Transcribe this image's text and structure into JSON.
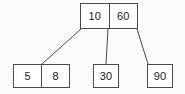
{
  "diagram": {
    "background_color": "#fbfbfa",
    "line_color": "#4a4a4a",
    "text_color": "#1a1a1a",
    "nodes": [
      {
        "id": "root",
        "role": "root-node",
        "keys": [
          "10",
          "60"
        ]
      },
      {
        "id": "leaf-1",
        "role": "leaf-node",
        "keys": [
          "5",
          "8"
        ]
      },
      {
        "id": "leaf-2",
        "role": "leaf-node",
        "keys": [
          "30"
        ]
      },
      {
        "id": "leaf-3",
        "role": "leaf-node",
        "keys": [
          "90"
        ]
      }
    ],
    "edges": [
      {
        "id": "edge-root-left",
        "from": "root",
        "to": "leaf-1",
        "x1": 81,
        "y1": 29,
        "x2": 42,
        "y2": 64
      },
      {
        "id": "edge-root-middle",
        "from": "root",
        "to": "leaf-2",
        "x1": 108,
        "y1": 29,
        "x2": 106,
        "y2": 64
      },
      {
        "id": "edge-root-right",
        "from": "root",
        "to": "leaf-3",
        "x1": 137,
        "y1": 29,
        "x2": 148,
        "y2": 64
      }
    ]
  }
}
